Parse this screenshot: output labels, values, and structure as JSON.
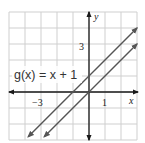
{
  "chart_data": {
    "type": "line",
    "title": "",
    "xlabel": "x",
    "ylabel": "y",
    "xlim": [
      -5,
      3
    ],
    "ylim": [
      -3,
      5
    ],
    "grid": true,
    "tick_labels": {
      "x": [
        {
          "value": -3,
          "label": "−3"
        },
        {
          "value": 1,
          "label": "1"
        }
      ],
      "y": [
        {
          "value": 3,
          "label": "3"
        }
      ]
    },
    "series": [
      {
        "name": "g(x) = x + 1",
        "equation": "y = x + 1",
        "points": [
          [
            -3.8,
            -2.8
          ],
          [
            3,
            4
          ]
        ],
        "arrows": "both"
      },
      {
        "name": "f(x) = x",
        "equation": "y = x",
        "points": [
          [
            -2.8,
            -2.8
          ],
          [
            3,
            3
          ]
        ],
        "arrows": "both"
      }
    ],
    "annotations": [
      {
        "text": "g(x) = x + 1",
        "x": -4.9,
        "y": 1.2
      }
    ]
  },
  "labels": {
    "function": "g(x) = x + 1",
    "x_axis": "x",
    "y_axis": "y",
    "tick_neg3": "−3",
    "tick_1": "1",
    "tick_3": "3"
  },
  "colors": {
    "grid": "#c8c8c8",
    "axis": "#1a1a1a",
    "line": "#555555",
    "text": "#333333"
  }
}
